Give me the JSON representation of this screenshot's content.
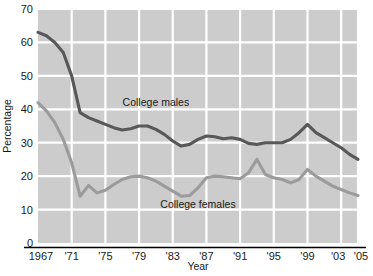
{
  "chart_data": {
    "type": "line",
    "title": "",
    "xlabel": "Year",
    "ylabel": "Percentage",
    "xlim": [
      1967,
      2005
    ],
    "ylim": [
      0,
      70
    ],
    "grid": true,
    "legend_position": "inline-annotation",
    "x_tick_labels": [
      "1967",
      "'71",
      "'75",
      "'79",
      "'83",
      "'87",
      "'91",
      "'95",
      "'99",
      "'03",
      "'05"
    ],
    "x_tick_values": [
      1967,
      1971,
      1975,
      1979,
      1983,
      1987,
      1991,
      1995,
      1999,
      2003,
      2005
    ],
    "y_tick_labels": [
      "0",
      "10",
      "20",
      "30",
      "40",
      "50",
      "60",
      "70"
    ],
    "y_tick_values": [
      0,
      10,
      20,
      30,
      40,
      50,
      60,
      70
    ],
    "x": [
      1967,
      1968,
      1969,
      1970,
      1971,
      1972,
      1973,
      1974,
      1975,
      1976,
      1977,
      1978,
      1979,
      1980,
      1981,
      1982,
      1983,
      1984,
      1985,
      1986,
      1987,
      1988,
      1989,
      1990,
      1991,
      1992,
      1993,
      1994,
      1995,
      1996,
      1997,
      1998,
      1999,
      2000,
      2001,
      2002,
      2003,
      2004,
      2005
    ],
    "series": [
      {
        "name": "College males",
        "color": "#58585a",
        "label_x": 1981,
        "label_y": 41,
        "values": [
          63,
          62,
          60,
          57,
          50,
          39,
          37.5,
          36.5,
          35.5,
          34.5,
          33.8,
          34.2,
          35,
          35,
          34,
          32.5,
          30.5,
          29,
          29.5,
          31,
          32,
          31.8,
          31.2,
          31.5,
          31,
          29.8,
          29.5,
          30,
          30,
          30,
          31,
          33,
          35.5,
          33,
          31.5,
          30,
          28.5,
          26.5,
          25
        ]
      },
      {
        "name": "College females",
        "color": "#9b9b9d",
        "label_x": 1986,
        "label_y": 10.5,
        "values": [
          42,
          39.5,
          36,
          31,
          24,
          14,
          17.2,
          15,
          15.8,
          17.5,
          19,
          19.8,
          20,
          19.5,
          18.5,
          17,
          15.5,
          14,
          14.2,
          16.5,
          19.5,
          20,
          19.8,
          19.5,
          19.2,
          21,
          25,
          20.5,
          19.5,
          19,
          18,
          19,
          22,
          20,
          18.5,
          17,
          16,
          15,
          14.2
        ]
      }
    ]
  },
  "colors": {
    "plot_background": "#cccccc",
    "gridline": "#ffffff",
    "axis_line": "#000000",
    "text": "#1a1a1a",
    "males_line": "#58585a",
    "females_line": "#9b9b9d",
    "page_background": "#ffffff"
  }
}
